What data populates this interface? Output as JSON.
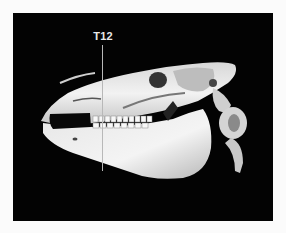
{
  "figure": {
    "background_color": "#030303",
    "page_background": "#fbfbfb",
    "marker": {
      "label": "T12",
      "line_color": "#b8b8b8"
    }
  }
}
